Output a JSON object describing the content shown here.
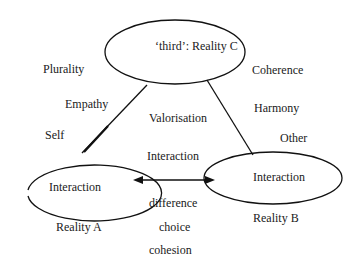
{
  "diagram": {
    "nodes": {
      "reality_c": {
        "label": "‘third’: Reality C"
      },
      "reality_a": {
        "label": "Interaction",
        "caption": "Reality A"
      },
      "reality_b": {
        "label": "Interaction",
        "caption": "Reality B"
      }
    },
    "edges": {
      "a_to_c": {
        "from": "reality_a",
        "to": "reality_c"
      },
      "b_to_c": {
        "from": "reality_b",
        "to": "reality_c"
      },
      "a_b": {
        "from": "reality_a",
        "to": "reality_b",
        "arrows": "both",
        "label_above": "Interaction"
      }
    },
    "left_labels": [
      "Plurality",
      "Empathy",
      "Self"
    ],
    "right_labels": [
      "Coherence",
      "Harmony",
      "Other"
    ],
    "center_label": "Valorisation",
    "bottom_labels": [
      "difference",
      "choice",
      "cohesion"
    ]
  }
}
